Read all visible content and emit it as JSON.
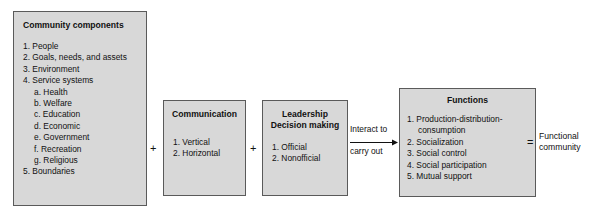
{
  "diagram": {
    "colors": {
      "box_fill": "#d8d8d8",
      "box_border": "#5a5a5a",
      "text": "#111111",
      "background": "#ffffff"
    },
    "boxes": [
      {
        "id": "community",
        "title": "Community components",
        "title_align": "left",
        "items": [
          {
            "num": "1.",
            "text": "People",
            "level": 1
          },
          {
            "num": "2.",
            "text": "Goals, needs, and assets",
            "level": 1
          },
          {
            "num": "3.",
            "text": "Environment",
            "level": 1
          },
          {
            "num": "4.",
            "text": "Service systems",
            "level": 1
          },
          {
            "num": "a.",
            "text": "Health",
            "level": 2
          },
          {
            "num": "b.",
            "text": "Welfare",
            "level": 2
          },
          {
            "num": "c.",
            "text": "Education",
            "level": 2
          },
          {
            "num": "d.",
            "text": "Economic",
            "level": 2
          },
          {
            "num": "e.",
            "text": "Government",
            "level": 2
          },
          {
            "num": "f.",
            "text": "Recreation",
            "level": 2
          },
          {
            "num": "g.",
            "text": "Religious",
            "level": 2
          },
          {
            "num": "5.",
            "text": "Boundaries",
            "level": 1
          }
        ]
      },
      {
        "id": "communication",
        "title": "Communication",
        "title_align": "center",
        "items": [
          {
            "num": "1.",
            "text": "Vertical",
            "level": 1
          },
          {
            "num": "2.",
            "text": "Horizontal",
            "level": 1
          }
        ]
      },
      {
        "id": "leadership",
        "title": "Leadership\nDecision making",
        "title_align": "center",
        "items": [
          {
            "num": "1.",
            "text": "Official",
            "level": 1
          },
          {
            "num": "2.",
            "text": "Nonofficial",
            "level": 1
          }
        ]
      },
      {
        "id": "functions",
        "title": "Functions",
        "title_align": "center",
        "items": [
          {
            "num": "1.",
            "text": "Production-distribution-\nconsumption",
            "level": 1
          },
          {
            "num": "2.",
            "text": "Socialization",
            "level": 1
          },
          {
            "num": "3.",
            "text": "Social control",
            "level": 1
          },
          {
            "num": "4.",
            "text": "Social participation",
            "level": 1
          },
          {
            "num": "5.",
            "text": "Mutual support",
            "level": 1
          }
        ]
      }
    ],
    "operators": {
      "plus_1": "+",
      "plus_2": "+",
      "equals": "="
    },
    "arrow": {
      "label_top": "Interact to",
      "label_bottom": "carry out",
      "icon": "arrow-right-icon"
    },
    "result": {
      "text": "Functional\ncommunity"
    }
  }
}
